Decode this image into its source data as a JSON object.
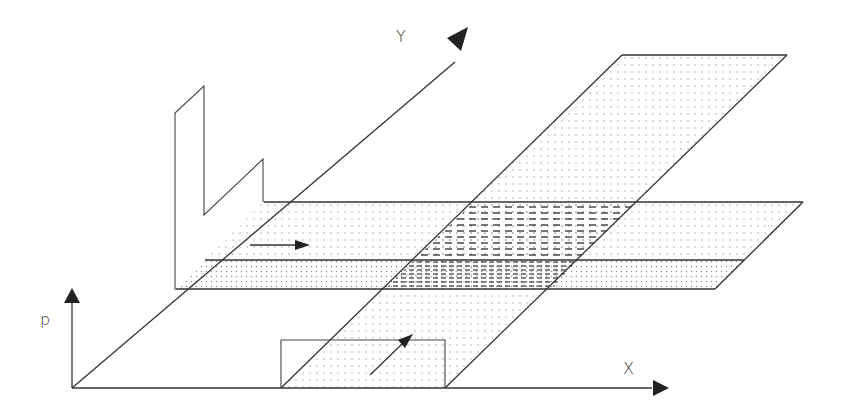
{
  "figure": {
    "axes": {
      "p_label": "p",
      "x_label": "X",
      "y_label": "Y"
    },
    "colors": {
      "line": "#333333",
      "dots": "#9a9a9a",
      "dash": "#3a3a3a",
      "background": "#ffffff"
    },
    "elements": {
      "x_band": "flow band along X direction (dotted)",
      "y_band": "flow band along Y direction (dotted)",
      "overlap": "intersection region (dashed hatch)",
      "profile_p_vs_y": "step pressure profile along Y",
      "profile_p_vs_x": "rectangular pressure pulse along X",
      "arrow_x": "flow direction arrow along X",
      "arrow_y": "flow direction arrow along Y"
    }
  }
}
